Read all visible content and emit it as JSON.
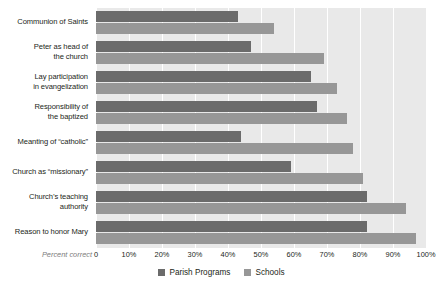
{
  "chart_data": {
    "type": "bar",
    "orientation": "horizontal",
    "title": "",
    "subtitle": "",
    "xlabel": "Percent correct",
    "ylabel": "",
    "xlim": [
      0,
      100
    ],
    "xticks": [
      "0",
      "10%",
      "20%",
      "30%",
      "40%",
      "50%",
      "60%",
      "70%",
      "80%",
      "90%",
      "100%"
    ],
    "xtick_values": [
      0,
      10,
      20,
      30,
      40,
      50,
      60,
      70,
      80,
      90,
      100
    ],
    "grid": true,
    "grid_axis": "x",
    "legend_position": "bottom-center",
    "categories": [
      "Communion of Saints",
      "Peter as head of the church",
      "Lay participation in evangelization",
      "Responsibility of the baptized",
      "Meanting of “catholic”",
      "Church as “missionary”",
      "Church’s teaching authority",
      "Reason to honor Mary"
    ],
    "category_lines": [
      [
        "Communion of Saints"
      ],
      [
        "Peter as head of",
        "the church"
      ],
      [
        "Lay participation",
        "in evangelization"
      ],
      [
        "Responsibility of",
        "the baptized"
      ],
      [
        "Meanting of “catholic”"
      ],
      [
        "Church as “missionary”"
      ],
      [
        "Church’s teaching",
        "authority"
      ],
      [
        "Reason to honor Mary"
      ]
    ],
    "series": [
      {
        "name": "Parish Programs",
        "color": "#6b6b6b",
        "values": [
          43,
          47,
          65,
          67,
          44,
          59,
          82,
          82
        ]
      },
      {
        "name": "Schools",
        "color": "#979797",
        "values": [
          54,
          69,
          73,
          76,
          78,
          81,
          94,
          97
        ]
      }
    ]
  },
  "legend": {
    "items": [
      {
        "label": "Parish Programs",
        "color": "#6b6b6b"
      },
      {
        "label": "Schools",
        "color": "#979797"
      }
    ]
  },
  "axis": {
    "percent_correct_label": "Percent correct"
  }
}
